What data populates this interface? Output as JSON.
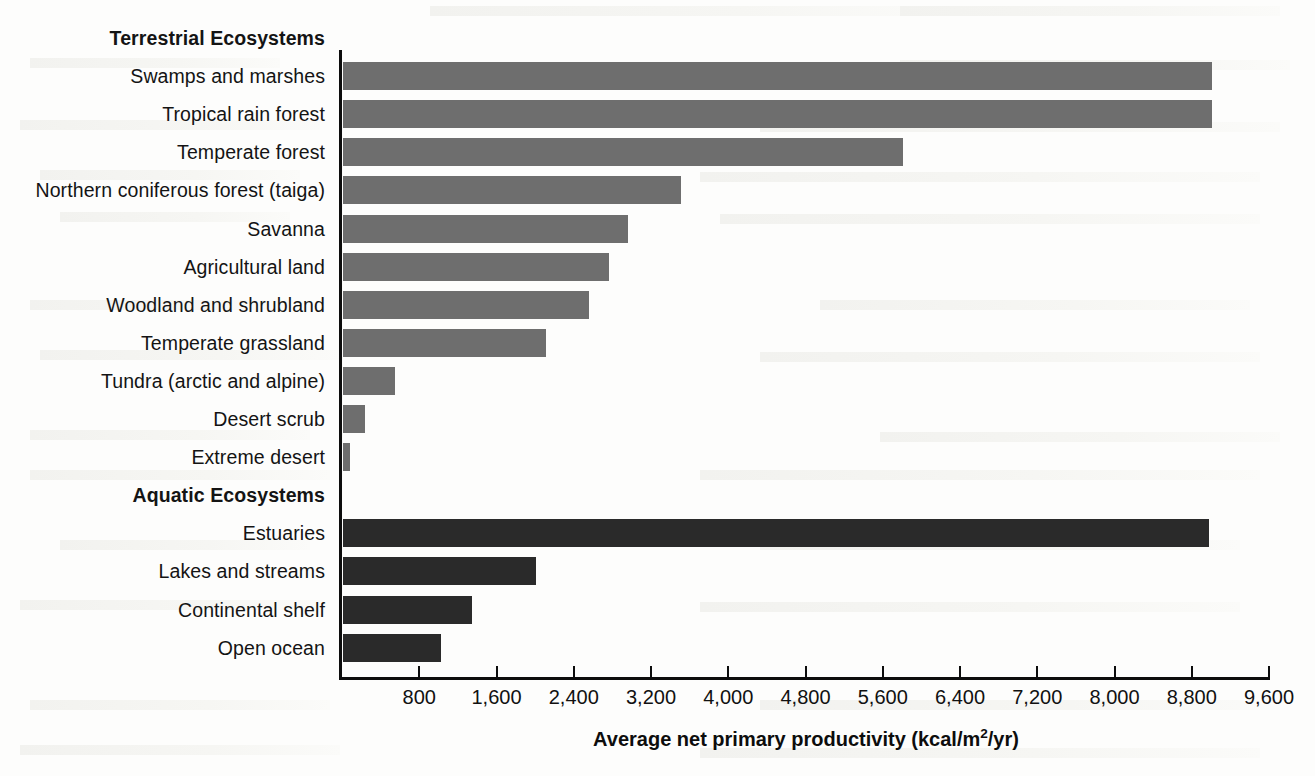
{
  "chart_data": {
    "type": "bar",
    "orientation": "horizontal",
    "title": "",
    "xlabel": "Average net primary productivity (kcal/m2/yr)",
    "xlabel_display": "Average net primary productivity (kcal/m",
    "xlabel_sup": "2",
    "xlabel_tail": "/yr)",
    "ylabel": "",
    "xlim": [
      0,
      9600
    ],
    "grid": false,
    "legend": "none",
    "tick_labels": [
      "800",
      "1,600",
      "2,400",
      "3,200",
      "4,000",
      "4,800",
      "5,600",
      "6,400",
      "7,200",
      "8,000",
      "8,800",
      "9,600"
    ],
    "tick_values": [
      800,
      1600,
      2400,
      3200,
      4000,
      4800,
      5600,
      6400,
      7200,
      8000,
      8800,
      9600
    ],
    "groups": [
      {
        "name": "Terrestrial Ecosystems",
        "color": "#6e6e6e",
        "categories": [
          "Swamps and marshes",
          "Tropical rain forest",
          "Temperate forest",
          "Northern coniferous forest (taiga)",
          "Savanna",
          "Agricultural land",
          "Woodland and shrubland",
          "Temperate grassland",
          "Tundra (arctic and alpine)",
          "Desert scrub",
          "Extreme desert"
        ],
        "values": [
          9000,
          9000,
          5800,
          3500,
          2950,
          2750,
          2550,
          2100,
          540,
          230,
          70
        ]
      },
      {
        "name": "Aquatic Ecosystems",
        "color": "#2a2a2a",
        "categories": [
          "Estuaries",
          "Lakes and streams",
          "Continental shelf",
          "Open ocean"
        ],
        "values": [
          8970,
          2000,
          1340,
          1020
        ]
      }
    ]
  },
  "rows": [
    {
      "label": "Terrestrial Ecosystems",
      "kind": "heading",
      "value": null,
      "group": "terrestrial"
    },
    {
      "label": "Swamps and marshes",
      "kind": "bar",
      "value": 9000,
      "group": "terrestrial"
    },
    {
      "label": "Tropical rain forest",
      "kind": "bar",
      "value": 9000,
      "group": "terrestrial"
    },
    {
      "label": "Temperate forest",
      "kind": "bar",
      "value": 5800,
      "group": "terrestrial"
    },
    {
      "label": "Northern coniferous forest (taiga)",
      "kind": "bar",
      "value": 3500,
      "group": "terrestrial"
    },
    {
      "label": "Savanna",
      "kind": "bar",
      "value": 2950,
      "group": "terrestrial"
    },
    {
      "label": "Agricultural land",
      "kind": "bar",
      "value": 2750,
      "group": "terrestrial"
    },
    {
      "label": "Woodland and shrubland",
      "kind": "bar",
      "value": 2550,
      "group": "terrestrial"
    },
    {
      "label": "Temperate grassland",
      "kind": "bar",
      "value": 2100,
      "group": "terrestrial"
    },
    {
      "label": "Tundra (arctic and alpine)",
      "kind": "bar",
      "value": 540,
      "group": "terrestrial"
    },
    {
      "label": "Desert scrub",
      "kind": "bar",
      "value": 230,
      "group": "terrestrial"
    },
    {
      "label": "Extreme desert",
      "kind": "bar",
      "value": 70,
      "group": "terrestrial"
    },
    {
      "label": "Aquatic Ecosystems",
      "kind": "heading",
      "value": null,
      "group": "aquatic"
    },
    {
      "label": "Estuaries",
      "kind": "bar",
      "value": 8970,
      "group": "aquatic"
    },
    {
      "label": "Lakes and streams",
      "kind": "bar",
      "value": 2000,
      "group": "aquatic"
    },
    {
      "label": "Continental shelf",
      "kind": "bar",
      "value": 1340,
      "group": "aquatic"
    },
    {
      "label": "Open ocean",
      "kind": "bar",
      "value": 1020,
      "group": "aquatic"
    }
  ],
  "colors": {
    "terrestrial_bar": "#6e6e6e",
    "aquatic_bar": "#2a2a2a",
    "axis": "#0d0d0d",
    "text": "#141414",
    "background": "#fdfdfc"
  }
}
